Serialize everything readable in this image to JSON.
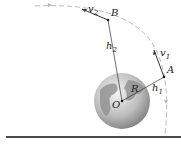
{
  "diagram": {
    "labels": {
      "point_b": "B",
      "point_a": "A",
      "center": "O",
      "radius": "R",
      "v2": "v",
      "v2_sub": "2",
      "v1": "v",
      "v1_sub": "1",
      "h2": "h",
      "h2_sub": "2",
      "h1": "h",
      "h1_sub": "1"
    },
    "colors": {
      "orbit": "#b8b8b8",
      "lines": "#333333",
      "ground": "#111111",
      "earth_light": "#e6e6e6",
      "earth_dark": "#8a8a8a"
    }
  }
}
